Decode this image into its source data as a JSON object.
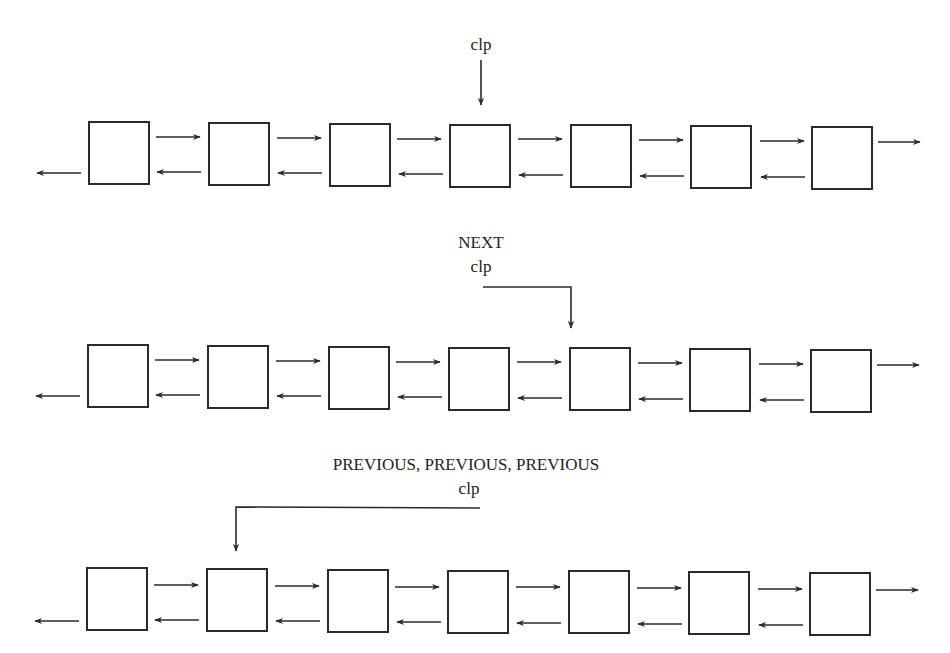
{
  "diagram": {
    "pointer_name": "clp",
    "stroke_color": "#2a2a2a",
    "node_count": 7,
    "panels": [
      {
        "id": "initial",
        "operation_label": "",
        "pointer_label": "clp",
        "pointer_target_index": 3,
        "node_y": 122,
        "label_y": 0
      },
      {
        "id": "after-next",
        "operation_label": "NEXT",
        "pointer_label": "clp",
        "pointer_target_index": 4,
        "node_y": 345,
        "label_y": 0
      },
      {
        "id": "after-previous-x3",
        "operation_label": "PREVIOUS, PREVIOUS, PREVIOUS",
        "pointer_label": "clp",
        "pointer_target_index": 1,
        "node_y": 568,
        "label_y": 0
      }
    ]
  },
  "texts": {
    "panel1_clp": "clp",
    "panel2_op": "NEXT",
    "panel2_clp": "clp",
    "panel3_op": "PREVIOUS, PREVIOUS, PREVIOUS",
    "panel3_clp": "clp"
  }
}
